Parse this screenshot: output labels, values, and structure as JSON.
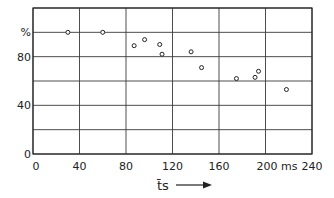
{
  "chart_data": {
    "type": "scatter",
    "title": "",
    "xlabel": "t̄s",
    "xunit": "ms",
    "ylabel": "%",
    "xlim": [
      0,
      240
    ],
    "ylim": [
      0,
      120
    ],
    "x_ticks": [
      0,
      40,
      80,
      120,
      160,
      200,
      240
    ],
    "x_tick_labels": [
      "0",
      "40",
      "80",
      "120",
      "160",
      "200 ms",
      "240"
    ],
    "y_ticks": [
      0,
      20,
      40,
      60,
      80,
      100,
      120
    ],
    "y_tick_labels": [
      "0",
      "",
      "40",
      "",
      "80",
      "%",
      ""
    ],
    "grid": true,
    "legend": "none",
    "series": [
      {
        "name": "measurements",
        "marker": "open-circle",
        "points": [
          {
            "x": 30,
            "y": 100
          },
          {
            "x": 60,
            "y": 100
          },
          {
            "x": 87,
            "y": 89
          },
          {
            "x": 96,
            "y": 94
          },
          {
            "x": 109,
            "y": 90
          },
          {
            "x": 111,
            "y": 82
          },
          {
            "x": 136,
            "y": 84
          },
          {
            "x": 145,
            "y": 71
          },
          {
            "x": 175,
            "y": 62
          },
          {
            "x": 191,
            "y": 63
          },
          {
            "x": 194,
            "y": 68
          },
          {
            "x": 218,
            "y": 53
          }
        ]
      }
    ]
  }
}
